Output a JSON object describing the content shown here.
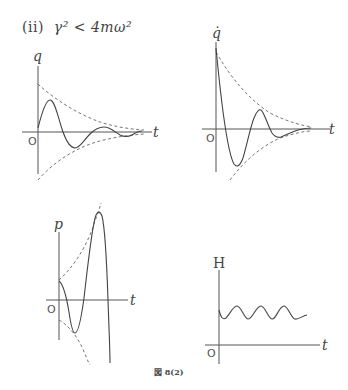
{
  "title": {
    "case": "(ii)",
    "condition": "γ² < 4mω²"
  },
  "caption": "図 8(2)",
  "graphs": [
    {
      "id": "q",
      "y_label": "q",
      "x_label": "t",
      "origin_label": "O",
      "description": "Damped oscillation of q(t): starts at 0, oscillates with decaying amplitude inside exponential envelope ±e^{-γt/2m}"
    },
    {
      "id": "q_dot",
      "y_label": "q̇",
      "x_label": "t",
      "origin_label": "O",
      "description": "Damped oscillation of q̇(t): starts at maximum, decays inside exponential envelope"
    },
    {
      "id": "p",
      "y_label": "p",
      "x_label": "t",
      "origin_label": "O",
      "description": "Growing oscillation of p(t) inside exponentially growing envelope"
    },
    {
      "id": "H",
      "y_label": "H",
      "x_label": "t",
      "origin_label": "O",
      "description": "H(t) oscillates around a constant positive value"
    }
  ]
}
